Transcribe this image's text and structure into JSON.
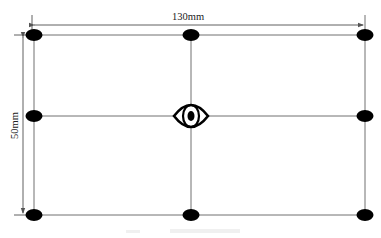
{
  "diagram": {
    "width_label": "130mm",
    "height_label": "50mm",
    "caption": "",
    "grid": {
      "columns_x": [
        34,
        191,
        365
      ],
      "rows_y": [
        35,
        116,
        215
      ]
    },
    "points": [
      {
        "row": 0,
        "col": 0
      },
      {
        "row": 0,
        "col": 1
      },
      {
        "row": 0,
        "col": 2
      },
      {
        "row": 1,
        "col": 0
      },
      {
        "row": 1,
        "col": 2
      },
      {
        "row": 2,
        "col": 0
      },
      {
        "row": 2,
        "col": 1
      },
      {
        "row": 2,
        "col": 2
      }
    ],
    "center_icon": "eye-icon",
    "colors": {
      "line": "#6f6f6f",
      "point": "#000000",
      "text": "#222222"
    }
  }
}
